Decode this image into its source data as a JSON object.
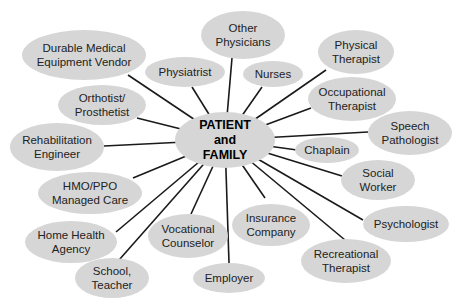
{
  "diagram": {
    "center": {
      "label": "PATIENT\nand\nFAMILY",
      "cx": 225,
      "cy": 140,
      "rx": 50,
      "ry": 28
    },
    "fill_color": "#d6d6d6",
    "line_color": "#1a1a1a",
    "nodes": [
      {
        "label": "Durable Medical\nEquipment Vendor",
        "cx": 84,
        "cy": 55,
        "rx": 62,
        "ry": 25,
        "ax": 128,
        "ay": 75
      },
      {
        "label": "Physiatrist",
        "cx": 185,
        "cy": 72,
        "rx": 40,
        "ry": 15,
        "ax": 192,
        "ay": 87
      },
      {
        "label": "Other\nPhysicians",
        "cx": 243,
        "cy": 35,
        "rx": 42,
        "ry": 24,
        "ax": 232,
        "ay": 58
      },
      {
        "label": "Nurses",
        "cx": 273,
        "cy": 74,
        "rx": 30,
        "ry": 13,
        "ax": 262,
        "ay": 87
      },
      {
        "label": "Physical\nTherapist",
        "cx": 356,
        "cy": 52,
        "rx": 38,
        "ry": 22,
        "ax": 326,
        "ay": 70
      },
      {
        "label": "Occupational\nTherapist",
        "cx": 352,
        "cy": 99,
        "rx": 44,
        "ry": 22,
        "ax": 311,
        "ay": 108
      },
      {
        "label": "Speech\nPathologist",
        "cx": 410,
        "cy": 133,
        "rx": 42,
        "ry": 22,
        "ax": 368,
        "ay": 132
      },
      {
        "label": "Chaplain",
        "cx": 327,
        "cy": 150,
        "rx": 32,
        "ry": 13,
        "ax": 297,
        "ay": 150
      },
      {
        "label": "Social\nWorker",
        "cx": 378,
        "cy": 180,
        "rx": 37,
        "ry": 20,
        "ax": 342,
        "ay": 176
      },
      {
        "label": "Psychologist",
        "cx": 406,
        "cy": 224,
        "rx": 43,
        "ry": 18,
        "ax": 363,
        "ay": 220
      },
      {
        "label": "Recreational\nTherapist",
        "cx": 346,
        "cy": 261,
        "rx": 45,
        "ry": 22,
        "ax": 345,
        "ay": 240
      },
      {
        "label": "Insurance\nCompany",
        "cx": 271,
        "cy": 225,
        "rx": 39,
        "ry": 21,
        "ax": 265,
        "ay": 198
      },
      {
        "label": "Employer",
        "cx": 229,
        "cy": 278,
        "rx": 36,
        "ry": 15,
        "ax": 229,
        "ay": 263
      },
      {
        "label": "Vocational\nCounselor",
        "cx": 188,
        "cy": 236,
        "rx": 40,
        "ry": 22,
        "ax": 191,
        "ay": 214
      },
      {
        "label": "School,\nTeacher",
        "cx": 112,
        "cy": 278,
        "rx": 37,
        "ry": 20,
        "ax": 119,
        "ay": 260
      },
      {
        "label": "Home Health\nAgency",
        "cx": 71,
        "cy": 242,
        "rx": 46,
        "ry": 21,
        "ax": 116,
        "ay": 232
      },
      {
        "label": "HMO/PPO\nManaged Care",
        "cx": 90,
        "cy": 193,
        "rx": 52,
        "ry": 21,
        "ax": 133,
        "ay": 178
      },
      {
        "label": "Rehabilitation\nEngineer",
        "cx": 57,
        "cy": 147,
        "rx": 47,
        "ry": 24,
        "ax": 104,
        "ay": 146
      },
      {
        "label": "Orthotist/\nProsthetist",
        "cx": 102,
        "cy": 105,
        "rx": 44,
        "ry": 20,
        "ax": 137,
        "ay": 118
      }
    ]
  }
}
